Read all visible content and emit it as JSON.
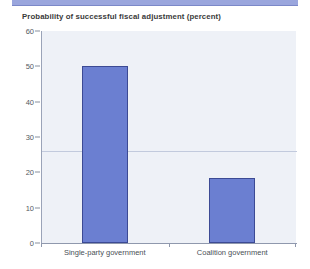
{
  "chart_data": {
    "type": "bar",
    "title": "Probability of successful fiscal adjustment (percent)",
    "xlabel": "",
    "ylabel": "",
    "categories": [
      "Single-party government",
      "Coalition government"
    ],
    "values": [
      50,
      18.5
    ],
    "ylim": [
      0,
      60
    ],
    "yticks": [
      0,
      10,
      20,
      30,
      40,
      50,
      60
    ],
    "ytick_labels": [
      "0",
      "10",
      "20",
      "30",
      "40",
      "50",
      "60"
    ],
    "grid": false,
    "legend": null,
    "series": [
      {
        "name": "Probability of successful fiscal adjustment",
        "values": [
          50,
          18.5
        ]
      }
    ],
    "annotations": [
      {
        "type": "horizontal-reference-line",
        "value": 26,
        "label": ""
      }
    ],
    "colors": {
      "bar_fill": "#6b7fd1",
      "bar_border": "#3c4a94",
      "plot_background": "#eef1f7",
      "banner": "#9aa6dd",
      "axis": "#8f98ad",
      "reference_line": "#c2cadd",
      "title_text": "#3a3a3a",
      "tick_text": "#555a61"
    }
  }
}
